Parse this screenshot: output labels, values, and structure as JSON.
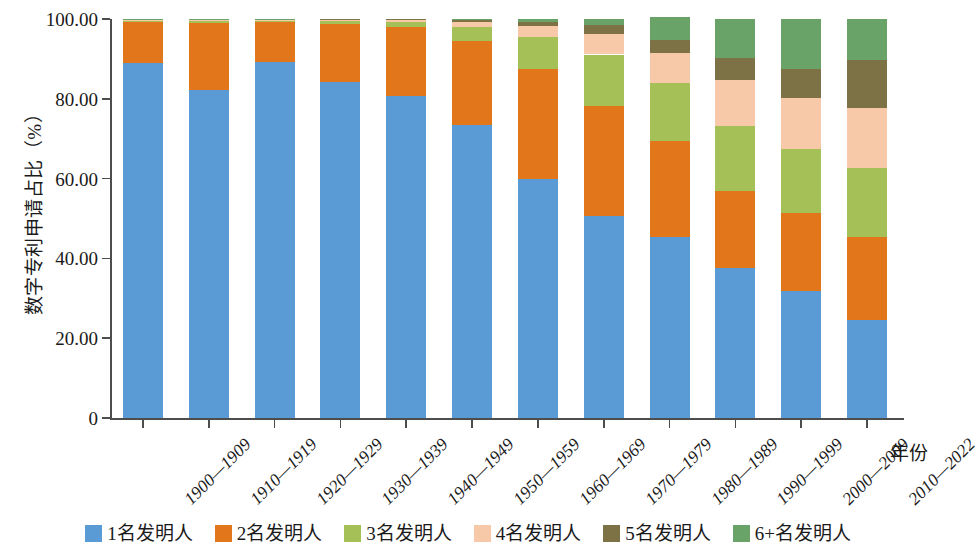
{
  "chart_data": {
    "type": "bar",
    "stacked": true,
    "stack_total": 100,
    "title": "",
    "xlabel": "年份",
    "ylabel": "数字专利申请占比（%）",
    "ylim": [
      0,
      100
    ],
    "yticks": [
      0,
      20,
      40,
      60,
      80,
      100
    ],
    "ytick_labels": [
      "0",
      "20.00",
      "40.00",
      "60.00",
      "80.00",
      "100.00"
    ],
    "grid": false,
    "legend_position": "bottom",
    "categories": [
      "1900—1909",
      "1910—1919",
      "1920—1929",
      "1930—1939",
      "1940—1949",
      "1950—1959",
      "1960—1969",
      "1970—1979",
      "1980—1989",
      "1990—1999",
      "2000—2009",
      "2010—2022"
    ],
    "series": [
      {
        "name": "1名发明人",
        "color": "#5b9bd5",
        "values": [
          89.0,
          82.2,
          89.2,
          84.2,
          80.8,
          73.4,
          60.0,
          50.6,
          45.4,
          37.6,
          31.8,
          24.5
        ]
      },
      {
        "name": "2名发明人",
        "color": "#e2761b",
        "values": [
          10.3,
          16.8,
          10.0,
          14.6,
          17.2,
          21.0,
          27.4,
          27.7,
          24.0,
          19.3,
          19.5,
          20.9
        ]
      },
      {
        "name": "3名发明人",
        "color": "#a5c057",
        "values": [
          0.5,
          0.7,
          0.5,
          0.8,
          1.3,
          3.6,
          8.0,
          12.8,
          14.6,
          16.4,
          16.1,
          17.3
        ]
      },
      {
        "name": "4名发明人",
        "color": "#f8c9a8",
        "values": [
          0.1,
          0.2,
          0.2,
          0.3,
          0.5,
          1.3,
          2.9,
          5.2,
          7.4,
          11.5,
          12.7,
          15.0
        ]
      },
      {
        "name": "5名发明人",
        "color": "#7d7246",
        "values": [
          0.05,
          0.05,
          0.05,
          0.1,
          0.2,
          0.5,
          1.0,
          2.1,
          3.4,
          5.5,
          7.3,
          12.0
        ]
      },
      {
        "name": "6+名发明人",
        "color": "#6aa368",
        "values": [
          0.05,
          0.05,
          0.05,
          0.0,
          0.0,
          0.2,
          0.7,
          1.6,
          5.6,
          9.7,
          12.6,
          10.3
        ]
      }
    ]
  },
  "axes": {
    "y_title": "数字专利申请占比（%）",
    "x_title": "年份",
    "y_labels": [
      "100.00",
      "80.00",
      "60.00",
      "40.00",
      "20.00",
      "0"
    ]
  },
  "legend": {
    "items": [
      {
        "label": "1名发明人",
        "color": "#5b9bd5"
      },
      {
        "label": "2名发明人",
        "color": "#e2761b"
      },
      {
        "label": "3名发明人",
        "color": "#a5c057"
      },
      {
        "label": "4名发明人",
        "color": "#f8c9a8"
      },
      {
        "label": "5名发明人",
        "color": "#7d7246"
      },
      {
        "label": "6+名发明人",
        "color": "#6aa368"
      }
    ]
  }
}
